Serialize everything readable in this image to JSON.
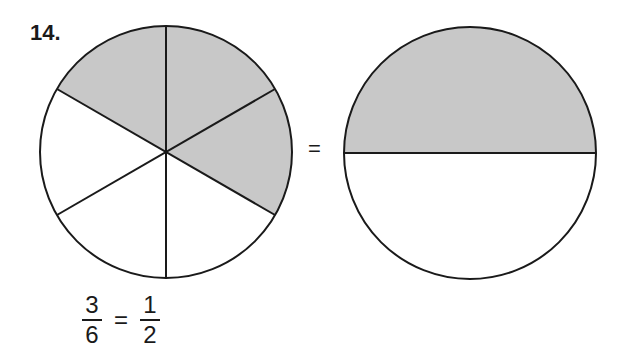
{
  "problem": {
    "number": "14.",
    "equals_symbol": "=",
    "left_fraction": {
      "numerator": "3",
      "denominator": "6"
    },
    "right_fraction": {
      "numerator": "1",
      "denominator": "2"
    },
    "left_circle": {
      "parts": 6,
      "shaded": 3
    },
    "right_circle": {
      "parts": 2,
      "shaded": 1
    },
    "colors": {
      "shade": "#c8c8c8",
      "stroke": "#1a1a1a"
    }
  }
}
